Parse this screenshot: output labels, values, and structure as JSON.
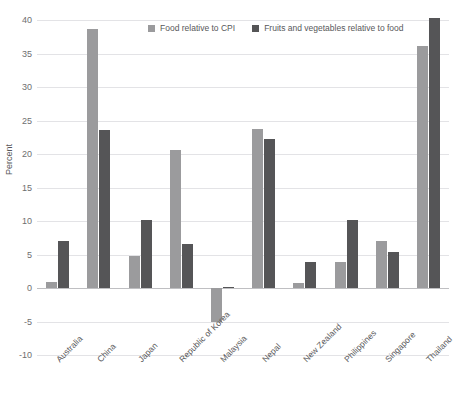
{
  "title_remnant": {
    "fragment_a": "",
    "fragment_b": "",
    "fragment_c": ""
  },
  "axis": {
    "ylabel": "Percent",
    "yticks": [
      "40",
      "35",
      "30",
      "25",
      "20",
      "15",
      "10",
      "5",
      "0",
      "-5",
      "-10"
    ]
  },
  "legend": {
    "items": [
      {
        "label": "Food relative to CPI",
        "color": "#9b9b9d"
      },
      {
        "label": "Fruits and vegetables relative to food",
        "color": "#555557"
      }
    ]
  },
  "chart_data": {
    "type": "bar",
    "title": "",
    "xlabel": "",
    "ylabel": "Percent",
    "ylim": [
      -10,
      40
    ],
    "ytick_values": [
      40,
      35,
      30,
      25,
      20,
      15,
      10,
      5,
      0,
      -5,
      -10
    ],
    "grid": true,
    "legend_position": "top-center",
    "categories": [
      "Australia",
      "China",
      "Japan",
      "Republic of Korea",
      "Malaysia",
      "Nepal",
      "New Zealand",
      "Philippines",
      "Singapore",
      "Thailand"
    ],
    "series": [
      {
        "name": "Food relative to CPI",
        "color": "#9b9b9d",
        "values": [
          0.9,
          38.7,
          4.8,
          20.6,
          -5.0,
          23.8,
          0.8,
          3.9,
          7.0,
          36.1
        ]
      },
      {
        "name": "Fruits and vegetables relative to food",
        "color": "#555557",
        "values": [
          7.0,
          23.6,
          10.1,
          6.6,
          0.2,
          22.2,
          3.9,
          10.2,
          5.4,
          40.3
        ]
      }
    ]
  }
}
